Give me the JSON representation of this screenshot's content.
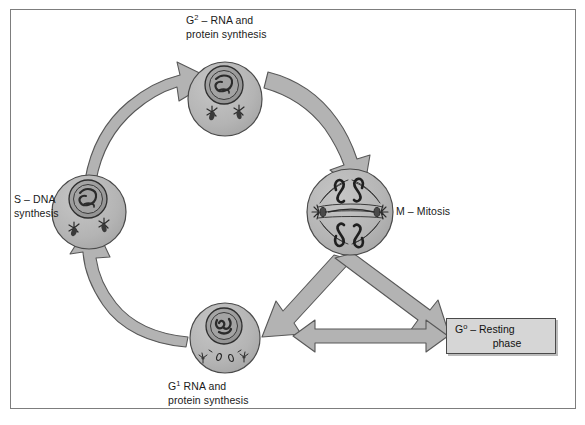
{
  "figure": {
    "type": "diagram",
    "background_color": "#ffffff",
    "frame_color": "#7d7d7d"
  },
  "colors": {
    "arrow_fill": "#b3b3b3",
    "arrow_stroke": "#585858",
    "cell_fill": "#b5b5b5",
    "cell_stroke": "#4a4a4a",
    "nucleus_fill": "#9a9a9a",
    "nucleus_stroke": "#2e2e2e",
    "box_fill": "#d6d6d6",
    "box_stroke": "#4a4a4a",
    "text_color": "#1a1a1a"
  },
  "phases": [
    {
      "id": "g2",
      "label_line1": "G",
      "label_sup": "2",
      "label_rest": " – RNA and",
      "label_line2": "protein synthesis",
      "full_label": "G2 – RNA and protein synthesis",
      "cell_description": "interphase cell with condensed nucleus and two centriole pairs"
    },
    {
      "id": "s",
      "label_line1": "S – DNA",
      "label_line2": "synthesis",
      "full_label": "S – DNA synthesis",
      "cell_description": "interphase cell with replicating nucleus and centrioles"
    },
    {
      "id": "m",
      "label_line1": "M – Mitosis",
      "label_line2": "",
      "full_label": "M – Mitosis",
      "cell_description": "dividing cell with mitotic spindle, chromosomes and polar centrioles"
    },
    {
      "id": "g1",
      "label_line1": "G",
      "label_sup": "1",
      "label_rest": " RNA and",
      "label_line2": "protein synthesis",
      "full_label": "G1 RNA and protein synthesis",
      "cell_description": "interphase cell with nucleus and dispersed centrioles"
    }
  ],
  "labels": {
    "g2_line1_pre": "G",
    "g2_line1_sup": "2",
    "g2_line1_post": " – RNA and",
    "g2_line2": "protein synthesis",
    "s_line1": "S – DNA",
    "s_line2": "synthesis",
    "m_line1": "M – Mitosis",
    "g1_line1_pre": "G",
    "g1_line1_sup": "1",
    "g1_line1_post": " RNA and",
    "g1_line2": "protein synthesis",
    "g0_line1_pre": "G",
    "g0_line1_sup": "o",
    "g0_line1_post": " – Resting",
    "g0_line2": "phase"
  },
  "g0_box": {
    "line1": "G° – Resting",
    "line2": "phase",
    "full_label": "G0 – Resting phase"
  },
  "arrows": [
    {
      "id": "arrow-g1-to-s",
      "from": "G1",
      "to": "S",
      "style": "curved-arc",
      "direction": "counterclockwise"
    },
    {
      "id": "arrow-s-to-g2",
      "from": "S",
      "to": "G2",
      "style": "curved-arc",
      "direction": "counterclockwise"
    },
    {
      "id": "arrow-g2-to-m",
      "from": "G2",
      "to": "M",
      "style": "curved-arc",
      "direction": "clockwise-descending"
    },
    {
      "id": "arrow-m-to-g1",
      "from": "M",
      "to": "G1",
      "style": "straight-diagonal",
      "direction": "down-left"
    },
    {
      "id": "arrow-m-to-g0",
      "from": "M",
      "to": "G0",
      "style": "straight-diagonal",
      "direction": "down-right"
    },
    {
      "id": "arrow-g1-g0-bidirectional",
      "from": "G1 region",
      "to": "G0 box",
      "style": "double-headed",
      "direction": "bidirectional"
    }
  ]
}
